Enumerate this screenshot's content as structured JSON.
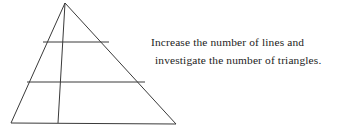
{
  "figure": {
    "caption_lines": [
      "Increase the number of lines and",
      "investigate the number of triangles."
    ],
    "colors": {
      "stroke": "#3a3a3a",
      "text": "#1c1c1c",
      "background": "#ffffff"
    },
    "diagram": {
      "name": "triangle-with-cevian-and-parallels",
      "stroke_width": 1,
      "vertices": {
        "apex": [
          65,
          3
        ],
        "bottom_left": [
          11,
          123
        ],
        "bottom_right": [
          176,
          124
        ]
      },
      "cevian": {
        "name": "apex-to-base-vertical",
        "from": [
          65,
          3
        ],
        "to": [
          58,
          123
        ]
      },
      "parallel_lines": [
        {
          "name": "upper-parallel",
          "from": [
            43,
            42
          ],
          "to": [
            109,
            42
          ]
        },
        {
          "name": "lower-parallel",
          "from": [
            27,
            82
          ],
          "to": [
            145,
            82
          ]
        }
      ]
    }
  }
}
